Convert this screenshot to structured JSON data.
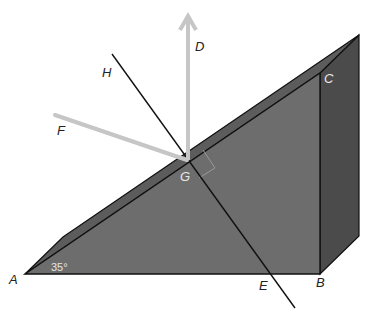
{
  "diagram": {
    "type": "geometry-prism-light-reflection",
    "colors": {
      "background": "#ffffff",
      "front_face": "#6b6b6b",
      "top_face": "#5a5a5a",
      "side_face": "#4a4a4a",
      "edge": "#111111",
      "ray": "#c4c4c4",
      "normal_line": "#111111",
      "right_angle_marker": "#9a9a9a"
    },
    "labels": {
      "A": "A",
      "B": "B",
      "C": "C",
      "D": "D",
      "E": "E",
      "F": "F",
      "G": "G",
      "H": "H"
    },
    "angle_label": "35°",
    "elements": [
      {
        "name": "prism",
        "description": "triangular wedge with right angle at B"
      },
      {
        "name": "ray-GD",
        "description": "vertical gray arrow from G upward to D"
      },
      {
        "name": "ray-FG",
        "description": "gray ray from F to G on incline"
      },
      {
        "name": "line-HE",
        "description": "black line through G perpendicular to incline AC, meeting AB at E"
      },
      {
        "name": "right-angle-marker",
        "description": "square at G between line HE and incline"
      }
    ]
  }
}
